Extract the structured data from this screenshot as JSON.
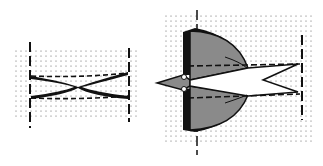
{
  "diagram": {
    "panels": [
      {
        "id": "left",
        "description": "crossed X-shaped linkage between two vertical dashed axes on dotted grid"
      },
      {
        "id": "right",
        "description": "bird-like shape with grey wings, arrow head pointing left, forked tail to right, dashed reference lines on dotted grid"
      }
    ],
    "colors": {
      "grid_dot": "#555555",
      "wing_fill": "#8a8a8a",
      "outline": "#111111",
      "background": "#ffffff"
    }
  }
}
